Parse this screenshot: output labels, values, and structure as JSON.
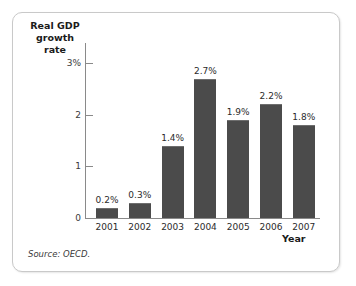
{
  "figure": {
    "source_note": "Source: OECD.",
    "frame_color": "#c9c9c9",
    "background": "#ffffff"
  },
  "chart_data": {
    "type": "bar",
    "title": "",
    "ylabel": "Real GDP\ngrowth rate",
    "ylabel_line1": "Real GDP",
    "ylabel_line2": "growth rate",
    "xlabel": "Year",
    "categories": [
      "2001",
      "2002",
      "2003",
      "2004",
      "2005",
      "2006",
      "2007"
    ],
    "values": [
      0.2,
      0.3,
      1.4,
      2.7,
      1.9,
      2.2,
      1.8
    ],
    "data_labels": [
      "0.2%",
      "0.3%",
      "1.4%",
      "2.7%",
      "1.9%",
      "2.2%",
      "1.8%"
    ],
    "ylim": [
      0,
      3
    ],
    "y_ticks": [
      0,
      1,
      2,
      3
    ],
    "y_tick_labels": [
      "0",
      "1",
      "2",
      "3%"
    ],
    "grid": false,
    "legend": false,
    "bar_color": "#4b4b4b",
    "axis_color": "#8a8a8a"
  }
}
